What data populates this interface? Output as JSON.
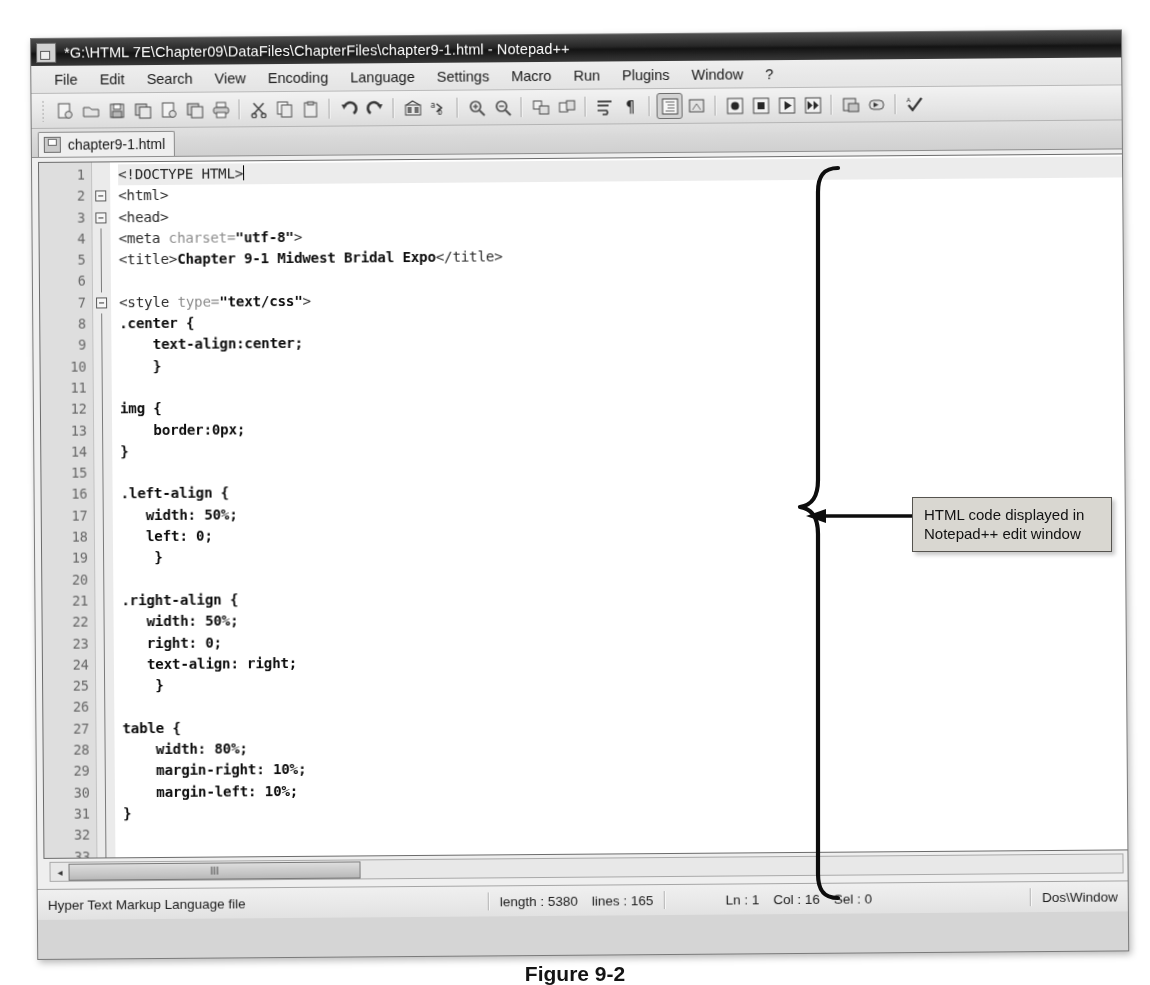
{
  "window": {
    "title": "*G:\\HTML 7E\\Chapter09\\DataFiles\\ChapterFiles\\chapter9-1.html - Notepad++",
    "title_icon": "notepad-plus-plus-icon"
  },
  "menu": {
    "items": [
      {
        "label": "File"
      },
      {
        "label": "Edit"
      },
      {
        "label": "Search"
      },
      {
        "label": "View"
      },
      {
        "label": "Encoding"
      },
      {
        "label": "Language"
      },
      {
        "label": "Settings"
      },
      {
        "label": "Macro"
      },
      {
        "label": "Run"
      },
      {
        "label": "Plugins"
      },
      {
        "label": "Window"
      },
      {
        "label": "?"
      }
    ]
  },
  "toolbar": {
    "buttons": [
      {
        "name": "new-file-icon"
      },
      {
        "name": "open-file-icon"
      },
      {
        "name": "save-icon"
      },
      {
        "name": "save-all-icon"
      },
      {
        "name": "close-file-icon"
      },
      {
        "name": "close-all-icon"
      },
      {
        "name": "print-icon"
      },
      {
        "name": "cut-icon"
      },
      {
        "name": "copy-icon"
      },
      {
        "name": "paste-icon"
      },
      {
        "name": "undo-icon"
      },
      {
        "name": "redo-icon"
      },
      {
        "name": "find-icon"
      },
      {
        "name": "replace-icon"
      },
      {
        "name": "zoom-in-icon"
      },
      {
        "name": "zoom-out-icon"
      },
      {
        "name": "sync-vertical-scroll-icon"
      },
      {
        "name": "sync-horizontal-scroll-icon"
      },
      {
        "name": "word-wrap-icon"
      },
      {
        "name": "show-all-characters-icon"
      },
      {
        "name": "indent-guideline-icon"
      },
      {
        "name": "user-defined-dialog-icon"
      },
      {
        "name": "record-macro-icon"
      },
      {
        "name": "stop-recording-macro-icon"
      },
      {
        "name": "play-macro-icon"
      },
      {
        "name": "run-macro-multiple-icon"
      },
      {
        "name": "save-macro-icon"
      },
      {
        "name": "run-icon"
      },
      {
        "name": "spell-check-icon"
      }
    ]
  },
  "tabs": [
    {
      "label": "chapter9-1.html",
      "icon": "html-file-icon",
      "active": true
    }
  ],
  "editor": {
    "caret_line": 1,
    "lines": [
      {
        "n": 1,
        "fold": "none",
        "segs": [
          {
            "t": "<!DOCTYPE HTML>",
            "c": "tag"
          }
        ],
        "caret": true
      },
      {
        "n": 2,
        "fold": "box",
        "segs": [
          {
            "t": "<html>",
            "c": "tag"
          }
        ]
      },
      {
        "n": 3,
        "fold": "box",
        "segs": [
          {
            "t": "<head>",
            "c": "tag"
          }
        ]
      },
      {
        "n": 4,
        "fold": "bar",
        "segs": [
          {
            "t": "<meta ",
            "c": "tag"
          },
          {
            "t": "charset=",
            "c": "attr"
          },
          {
            "t": "\"utf-8\"",
            "c": "val"
          },
          {
            "t": ">",
            "c": "tag"
          }
        ]
      },
      {
        "n": 5,
        "fold": "bar",
        "segs": [
          {
            "t": "<title>",
            "c": "tag"
          },
          {
            "t": "Chapter 9-1 Midwest Bridal Expo",
            "c": "txt"
          },
          {
            "t": "</title>",
            "c": "tag"
          }
        ]
      },
      {
        "n": 6,
        "fold": "bar",
        "segs": []
      },
      {
        "n": 7,
        "fold": "box",
        "segs": [
          {
            "t": "<style ",
            "c": "tag"
          },
          {
            "t": "type=",
            "c": "attr"
          },
          {
            "t": "\"text/css\"",
            "c": "val"
          },
          {
            "t": ">",
            "c": "tag"
          }
        ]
      },
      {
        "n": 8,
        "fold": "bar",
        "segs": [
          {
            "t": ".center {",
            "c": "cssb"
          }
        ]
      },
      {
        "n": 9,
        "fold": "bar",
        "segs": [
          {
            "t": "    text-align:center;",
            "c": "cssb"
          }
        ]
      },
      {
        "n": 10,
        "fold": "bar",
        "segs": [
          {
            "t": "    }",
            "c": "cssb"
          }
        ]
      },
      {
        "n": 11,
        "fold": "bar",
        "segs": []
      },
      {
        "n": 12,
        "fold": "bar",
        "segs": [
          {
            "t": "img {",
            "c": "cssb"
          }
        ]
      },
      {
        "n": 13,
        "fold": "bar",
        "segs": [
          {
            "t": "    border:0px;",
            "c": "cssb"
          }
        ]
      },
      {
        "n": 14,
        "fold": "bar",
        "segs": [
          {
            "t": "}",
            "c": "cssb"
          }
        ]
      },
      {
        "n": 15,
        "fold": "bar",
        "segs": []
      },
      {
        "n": 16,
        "fold": "bar",
        "segs": [
          {
            "t": ".left-align {",
            "c": "cssb"
          }
        ]
      },
      {
        "n": 17,
        "fold": "bar",
        "segs": [
          {
            "t": "   width: 50%;",
            "c": "cssb"
          }
        ]
      },
      {
        "n": 18,
        "fold": "bar",
        "segs": [
          {
            "t": "   left: 0;",
            "c": "cssb"
          }
        ]
      },
      {
        "n": 19,
        "fold": "bar",
        "segs": [
          {
            "t": "    }",
            "c": "cssb"
          }
        ]
      },
      {
        "n": 20,
        "fold": "bar",
        "segs": []
      },
      {
        "n": 21,
        "fold": "bar",
        "segs": [
          {
            "t": ".right-align {",
            "c": "cssb"
          }
        ]
      },
      {
        "n": 22,
        "fold": "bar",
        "segs": [
          {
            "t": "   width: 50%;",
            "c": "cssb"
          }
        ]
      },
      {
        "n": 23,
        "fold": "bar",
        "segs": [
          {
            "t": "   right: 0;",
            "c": "cssb"
          }
        ]
      },
      {
        "n": 24,
        "fold": "bar",
        "segs": [
          {
            "t": "   text-align: right;",
            "c": "cssb"
          }
        ]
      },
      {
        "n": 25,
        "fold": "bar",
        "segs": [
          {
            "t": "    }",
            "c": "cssb"
          }
        ]
      },
      {
        "n": 26,
        "fold": "bar",
        "segs": []
      },
      {
        "n": 27,
        "fold": "bar",
        "segs": [
          {
            "t": "table {",
            "c": "cssb"
          }
        ]
      },
      {
        "n": 28,
        "fold": "bar",
        "segs": [
          {
            "t": "    width: 80%;",
            "c": "cssb"
          }
        ]
      },
      {
        "n": 29,
        "fold": "bar",
        "segs": [
          {
            "t": "    margin-right: 10%;",
            "c": "cssb"
          }
        ]
      },
      {
        "n": 30,
        "fold": "bar",
        "segs": [
          {
            "t": "    margin-left: 10%;",
            "c": "cssb"
          }
        ]
      },
      {
        "n": 31,
        "fold": "bar",
        "segs": [
          {
            "t": "}",
            "c": "cssb"
          }
        ]
      },
      {
        "n": 32,
        "fold": "bar",
        "segs": []
      },
      {
        "n": 33,
        "fold": "bar",
        "segs": [
          {
            "t": "  .  .  .",
            "c": "cssb"
          }
        ]
      }
    ]
  },
  "scrollbar": {
    "left_arrow": "◂",
    "thumb_grip": "III"
  },
  "status_bar": {
    "file_type": "Hyper Text Markup Language file",
    "length_label": "length : 5380",
    "lines_label": "lines : 165",
    "ln": "Ln : 1",
    "col": "Col : 16",
    "sel": "Sel : 0",
    "eol": "Dos\\Window"
  },
  "annotation": {
    "callout_text": "HTML code displayed in Notepad++ edit window",
    "callout_line1": "HTML code displayed in",
    "callout_line2": "Notepad++ edit window",
    "brace": "right-curly-brace",
    "arrow": "left-arrow"
  },
  "figure": {
    "caption": "Figure 9-2"
  },
  "colors": {
    "window_chrome": "#d4d2cc",
    "titlebar": "#1f1f1f",
    "editor_bg": "#ffffff",
    "gutter_bg": "#dcdad4",
    "callout_bg": "#d9d7d1",
    "annotation_stroke": "#000000"
  }
}
